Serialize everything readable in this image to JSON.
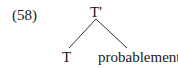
{
  "example_number": "(58)",
  "tree": {
    "root": "T'",
    "left_child": "T",
    "right_child": "probablement"
  }
}
